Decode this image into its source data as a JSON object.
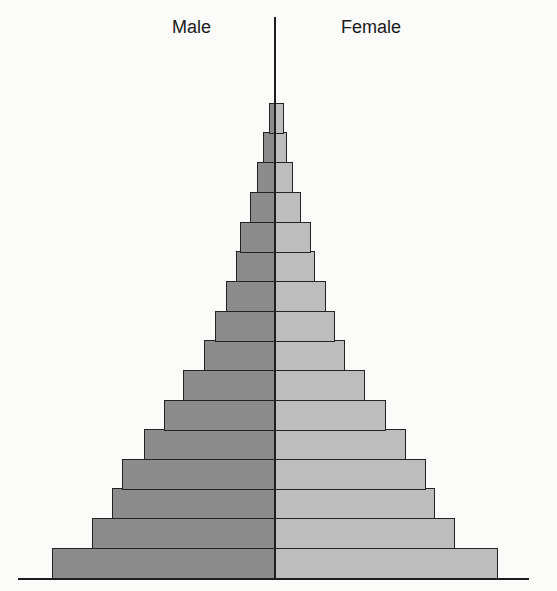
{
  "labels": {
    "male": "Male",
    "female": "Female"
  },
  "colors": {
    "male_fill": "#8c8c8c",
    "female_fill": "#bdbdbd",
    "outline": "#232323",
    "background": "#fbfbfa"
  },
  "chart_data": {
    "type": "bar",
    "orientation": "horizontal",
    "subtype": "population-pyramid",
    "title": "",
    "xlabel": "",
    "ylabel": "",
    "legend": [
      "Male",
      "Female"
    ],
    "legend_position": "top",
    "grid": false,
    "axis_ticks": "none",
    "units": "relative bar length (px from center axis, unlabeled)",
    "categories_note": "16 unlabeled age cohorts, youngest at bottom",
    "categories": [
      "1",
      "2",
      "3",
      "4",
      "5",
      "6",
      "7",
      "8",
      "9",
      "10",
      "11",
      "12",
      "13",
      "14",
      "15",
      "16"
    ],
    "series": [
      {
        "name": "Male",
        "values": [
          223,
          183,
          163,
          153,
          131,
          111,
          92,
          71,
          60,
          49,
          39,
          35,
          25,
          18,
          12,
          6
        ]
      },
      {
        "name": "Female",
        "values": [
          223,
          180,
          160,
          151,
          131,
          111,
          90,
          70,
          60,
          51,
          40,
          36,
          26,
          18,
          12,
          9
        ]
      }
    ],
    "layout": {
      "center_x": 275,
      "row_tops": [
        548,
        518,
        488,
        459,
        429,
        400,
        370,
        340,
        311,
        281,
        251,
        222,
        192,
        162,
        132,
        103
      ],
      "row_height": 30,
      "axis_top": 17,
      "baseline_y": 578,
      "baseline_x": [
        18,
        529
      ]
    }
  }
}
